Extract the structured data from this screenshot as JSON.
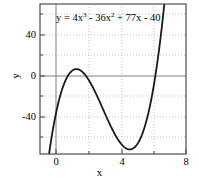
{
  "chart_data": {
    "type": "line",
    "title": "",
    "annotation": "y = 4x^3 - 36x^2 + 77x - 40",
    "annotation_parts": {
      "lead": "y = 4x",
      "exp1": "3",
      "mid": " - 36x",
      "exp2": "2",
      "tail": " + 77x - 40"
    },
    "equation": {
      "coefficients": [
        4,
        -36,
        77,
        -40
      ],
      "degree": 3
    },
    "xlabel": "x",
    "ylabel": "y",
    "xlim": [
      -0.8,
      8.0
    ],
    "ylim": [
      -62,
      62
    ],
    "xticks": [
      "0",
      "4",
      "8"
    ],
    "xtick_values": [
      0,
      4,
      8
    ],
    "yticks": [
      "40",
      "0",
      "-40"
    ],
    "ytick_values": [
      40,
      0,
      -40
    ],
    "grid": true,
    "grid_style": "dotted",
    "grid_x_values": [
      0,
      2,
      4,
      6,
      8
    ],
    "grid_y_values": [
      40,
      20,
      0,
      -20,
      -40
    ],
    "legend": "none",
    "series": [
      {
        "name": "y = 4x^3 - 36x^2 + 77x - 40",
        "color": "#1a1a1a",
        "line_width": 1.8,
        "roots": [
          0.78,
          3.33,
          4.89
        ],
        "local_max": {
          "x": 1.52,
          "y": 9.0
        },
        "local_min": {
          "x": 5.48,
          "y": -55.0
        },
        "x": [
          -0.8,
          -0.6,
          -0.4,
          -0.2,
          0.0,
          0.2,
          0.4,
          0.6,
          0.8,
          1.0,
          1.2,
          1.4,
          1.6,
          1.8,
          2.0,
          2.2,
          2.4,
          2.6,
          2.8,
          3.0,
          3.2,
          3.4,
          3.6,
          3.8,
          4.0,
          4.2,
          4.4,
          4.6,
          4.8,
          5.0,
          5.2,
          5.4,
          5.6,
          5.8,
          6.0,
          6.2,
          6.4,
          6.6,
          6.8,
          7.0,
          7.2
        ],
        "y": [
          -127.2,
          -101.7,
          -77.9,
          -55.7,
          -40.0,
          -26.1,
          -13.8,
          -3.0,
          6.4,
          15.0,
          21.2,
          26.0,
          29.5,
          31.8,
          33.0,
          33.1,
          32.3,
          30.6,
          28.1,
          24.9,
          21.1,
          16.8,
          12.1,
          7.1,
          1.9,
          -3.5,
          -8.9,
          -14.2,
          -19.3,
          -24.2,
          -28.5,
          -32.3,
          -35.4,
          -37.6,
          -38.8,
          -39.0,
          -37.9,
          -35.4,
          -31.4,
          -25.8,
          -18.4
        ]
      }
    ]
  },
  "axes": {
    "x_title": "x",
    "y_title": "y"
  },
  "colors": {
    "curve": "#1a1a1a",
    "frame": "#4d4d4d",
    "axis_line": "#808080",
    "grid": "#b3b3b3",
    "background": "#ffffff"
  }
}
